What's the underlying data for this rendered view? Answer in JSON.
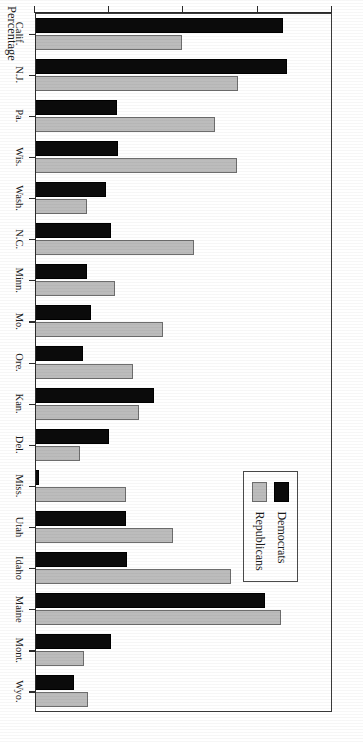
{
  "chart_data": {
    "type": "bar",
    "orientation": "horizontal",
    "title": "",
    "xlabel": "",
    "ylabel": "Percentage",
    "value_axis_label": "Percentage",
    "categories": [
      "Calif.",
      "N.J.",
      "Pa.",
      "Wis.",
      "Wash.",
      "N.C.",
      "Minn.",
      "Mo.",
      "Ore.",
      "Kan.",
      "Del.",
      "Miss.",
      "Utah",
      "Idaho",
      "Maine",
      "Mont.",
      "Wyo."
    ],
    "series": [
      {
        "name": "Democrats",
        "color": "#0b0b0b",
        "values": [
          16.7,
          17.0,
          5.5,
          5.6,
          4.8,
          5.1,
          3.5,
          3.8,
          3.2,
          8.0,
          5.0,
          0.3,
          6.1,
          6.2,
          15.5,
          5.1,
          2.6
        ]
      },
      {
        "name": "Republicans",
        "color": "#bcbcbc",
        "values": [
          9.9,
          13.7,
          12.1,
          13.6,
          3.5,
          10.7,
          5.4,
          8.6,
          6.6,
          7.0,
          3.0,
          6.1,
          9.3,
          13.2,
          16.6,
          3.3,
          3.6
        ]
      }
    ],
    "ticks": [
      0,
      5,
      10,
      15,
      20
    ],
    "tick_labels": [
      "0",
      "5",
      "10",
      "15",
      "20"
    ],
    "ylim": [
      0,
      20
    ],
    "grid": false,
    "legend_position": "inside-upper-left",
    "legend_entries": [
      "Democrats",
      "Republicans"
    ]
  },
  "legend": {
    "democrats_label": "Democrats",
    "republicans_label": "Republicans"
  },
  "axis": {
    "percentage_title": "Percentage"
  }
}
